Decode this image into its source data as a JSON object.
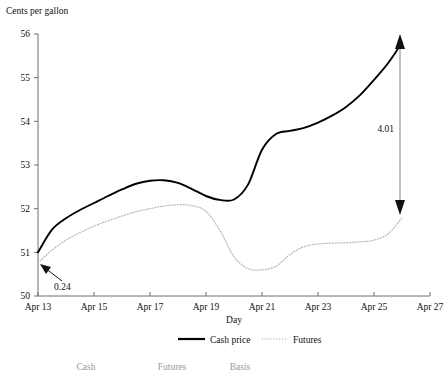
{
  "chart_data": {
    "type": "line",
    "title": "",
    "ylabel": "Cents per gallon",
    "xlabel": "Day",
    "xlim": [
      13,
      27
    ],
    "ylim": [
      50,
      56
    ],
    "grid": false,
    "legend_position": "bottom-center",
    "x_tick_labels": [
      "Apr 13",
      "Apr 15",
      "Apr 17",
      "Apr 19",
      "Apr 21",
      "Apr 23",
      "Apr 25",
      "Apr 27"
    ],
    "x_tick_values": [
      13,
      15,
      17,
      19,
      21,
      23,
      25,
      27
    ],
    "y_tick_labels": [
      "50",
      "51",
      "52",
      "53",
      "54",
      "55",
      "56"
    ],
    "y_tick_values": [
      50,
      51,
      52,
      53,
      54,
      55,
      56
    ],
    "x": [
      13,
      13.5,
      14,
      14.5,
      15,
      15.5,
      16,
      16.5,
      17,
      17.5,
      18,
      18.5,
      19,
      19.5,
      20,
      20.5,
      21,
      21.5,
      22,
      22.5,
      23,
      23.5,
      24,
      24.5,
      25,
      25.5,
      26
    ],
    "series": [
      {
        "name": "Cash price",
        "style": "solid",
        "color": "#000000",
        "values": [
          51.0,
          51.52,
          51.78,
          51.97,
          52.13,
          52.29,
          52.44,
          52.57,
          52.64,
          52.65,
          52.59,
          52.45,
          52.29,
          52.2,
          52.21,
          52.55,
          53.35,
          53.71,
          53.78,
          53.85,
          53.97,
          54.13,
          54.33,
          54.6,
          54.95,
          55.33,
          55.8
        ]
      },
      {
        "name": "Futures",
        "style": "dotted",
        "color": "#b9b9b9",
        "values": [
          50.76,
          51.05,
          51.28,
          51.45,
          51.6,
          51.72,
          51.83,
          51.93,
          52.0,
          52.06,
          52.09,
          52.07,
          51.94,
          51.5,
          50.9,
          50.63,
          50.6,
          50.68,
          50.95,
          51.13,
          51.19,
          51.21,
          51.22,
          51.24,
          51.28,
          51.42,
          51.79
        ]
      }
    ],
    "annotations": [
      {
        "name": "basis-start",
        "label": "0.24",
        "x": 13,
        "y_from": 50.76,
        "y_to": 51.0,
        "kind": "pointer-arrow"
      },
      {
        "name": "basis-end",
        "label": "4.01",
        "x": 26,
        "y_from": 51.79,
        "y_to": 55.8,
        "kind": "double-arrow"
      }
    ]
  },
  "legend": {
    "items": [
      {
        "label": "Cash price",
        "style": "solid"
      },
      {
        "label": "Futures",
        "style": "dotted"
      }
    ]
  },
  "footer": {
    "columns": [
      "Cash",
      "Futures",
      "Basis"
    ]
  }
}
